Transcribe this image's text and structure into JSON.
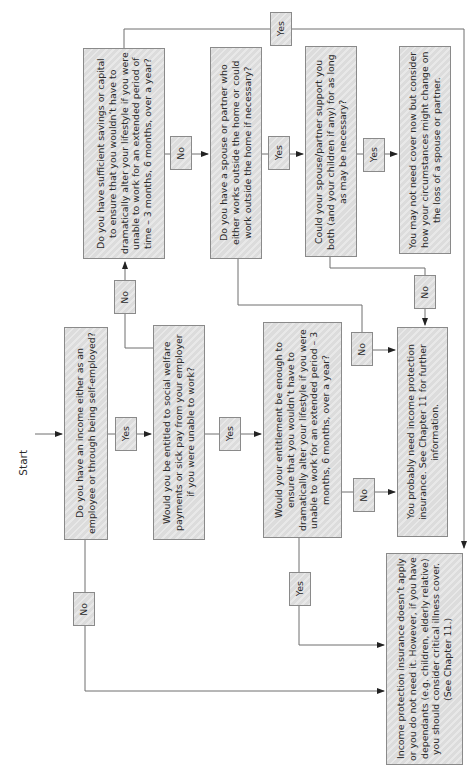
{
  "start_label": "Start",
  "nodes": {
    "q_income": "Do you have an income either as an employee or through being self-employed?",
    "q_social_welfare": "Would you be entitled to social welfare payments or sick pay from your employer if you were unable to work?",
    "q_entitlement_enough": "Would your entitlement be enough to ensure that you wouldn’t have to dramatically alter your lifestyle if you were unable to work for an extended period – 3 months, 6 months, over a year?",
    "q_savings": "Do you have sufficient savings or capital to ensure that you wouldn’t have to dramatically alter your lifestyle if you were unable to work for an extended period of time – 3 months, 6 months, over a year?",
    "q_spouse_works": "Do you have a spouse or partner who either works outside the home or could work outside the home if necessary?",
    "q_spouse_support": "Could your spouse/partner support you both (and your children if any) for as long as may be necessary?",
    "r_may_not_need": "You may not need cover now but consider how your circumstances might change on the loss of a spouse or partner.",
    "r_probably_need": "You probably need income protection insurance. See Chapter 11 for further information.",
    "r_not_apply": "Income protection insurance doesn’t apply or you do not need it. However, if you have dependants (e.g. children, elderly relative) you should consider critical illness cover. (See Chapter 11.)"
  },
  "edges": {
    "income_yes": "Yes",
    "income_no": "No",
    "welfare_yes": "Yes",
    "welfare_no": "No",
    "entitlement_yes": "Yes",
    "entitlement_no": "No",
    "savings_yes": "Yes",
    "savings_no": "No",
    "spouse_works_yes": "Yes",
    "spouse_works_no": "No",
    "spouse_support_yes": "Yes",
    "spouse_support_no": "No"
  },
  "colors": {
    "box_fill": "#dcdcdc",
    "box_border": "#8a8a8a",
    "line": "#6e6e6e",
    "text": "#2a2a2a"
  }
}
